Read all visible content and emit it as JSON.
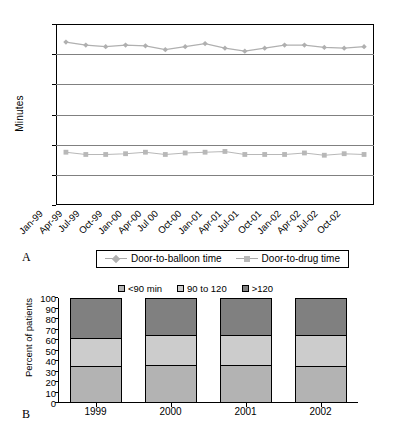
{
  "figure": {
    "panel_a_letter": "A",
    "panel_b_letter": "B"
  },
  "chart_data": [
    {
      "type": "line",
      "panel": "A",
      "title": "",
      "xlabel": "",
      "ylabel": "Minutes",
      "ylim": [
        0,
        120
      ],
      "yticks": [
        0,
        20,
        40,
        60,
        80,
        100,
        120
      ],
      "grid": true,
      "legend_position": "bottom",
      "categories": [
        "Jan-99",
        "Apr-99",
        "Jul-99",
        "Oct-99",
        "Jan-00",
        "Apr-00",
        "Jul 00",
        "Oct-00",
        "Jan-01",
        "Apr-01",
        "Jul-01",
        "Oct-01",
        "Jan-02",
        "Apr-02",
        "Jul-02",
        "Oct-02"
      ],
      "series": [
        {
          "name": "Door-to-balloon time",
          "marker": "diamond",
          "color": "#b0b0b0",
          "values": [
            108,
            106,
            105,
            106,
            105.5,
            103,
            105,
            107,
            104,
            102,
            104,
            106,
            106,
            104.5,
            104,
            105
          ]
        },
        {
          "name": "Door-to-drug time",
          "marker": "square",
          "color": "#b8b8b8",
          "values": [
            35,
            33.5,
            33.5,
            34,
            35,
            33.5,
            34.5,
            35,
            35.5,
            33.5,
            33.5,
            33.5,
            34.5,
            33,
            34,
            33.5
          ]
        }
      ]
    },
    {
      "type": "bar",
      "panel": "B",
      "stacked": true,
      "title": "",
      "xlabel": "",
      "ylabel": "Percent of patients",
      "ylim": [
        0,
        100
      ],
      "yticks": [
        0,
        10,
        20,
        30,
        40,
        50,
        60,
        70,
        80,
        90,
        100
      ],
      "grid": false,
      "legend_position": "top",
      "categories": [
        "1999",
        "2000",
        "2001",
        "2002"
      ],
      "series": [
        {
          "name": "<90 min",
          "color": "#b3b3b3",
          "values": [
            35,
            36,
            36,
            35
          ]
        },
        {
          "name": "90 to 120",
          "color": "#cccccc",
          "values": [
            27,
            29,
            29,
            30
          ]
        },
        {
          "name": ">120",
          "color": "#808080",
          "values": [
            38,
            35,
            35,
            35
          ]
        }
      ]
    }
  ]
}
